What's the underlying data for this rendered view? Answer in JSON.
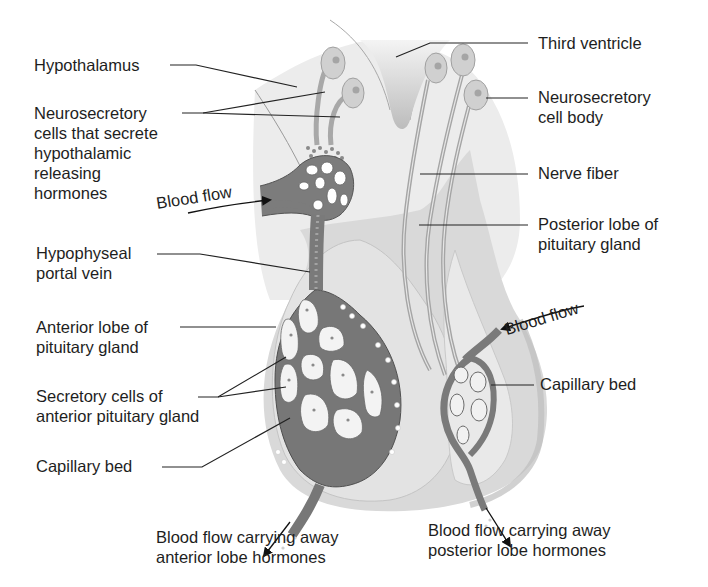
{
  "diagram": {
    "colors": {
      "background": "#ffffff",
      "tissue_light": "#ececec",
      "tissue_mid": "#d6d6d6",
      "tissue_dark": "#bdbdbd",
      "vessel": "#6e6e6e",
      "vessel_fill": "#8f8f8f",
      "cell_fill": "#f4f4f4",
      "line": "#222222"
    },
    "labels_left": {
      "hypothalamus": "Hypothalamus",
      "neurosecretory_cells": [
        "Neurosecretory",
        "cells that secrete",
        "hypothalamic",
        "releasing",
        "hormones"
      ],
      "hypophyseal_portal_vein": [
        "Hypophyseal",
        "portal vein"
      ],
      "anterior_lobe": [
        "Anterior lobe of",
        "pituitary gland"
      ],
      "secretory_cells": [
        "Secretory cells of",
        "anterior pituitary gland"
      ],
      "capillary_bed": "Capillary bed"
    },
    "labels_right": {
      "third_ventricle": "Third ventricle",
      "neurosecretory_cell_body": [
        "Neurosecretory",
        "cell body"
      ],
      "nerve_fiber": "Nerve fiber",
      "posterior_lobe": [
        "Posterior lobe of",
        "pituitary gland"
      ],
      "capillary_bed": "Capillary bed"
    },
    "flow_labels": {
      "blood_flow_in_anterior": "Blood flow",
      "blood_flow_in_posterior": "Blood flow"
    },
    "labels_bottom": {
      "anterior_out": [
        "Blood flow carrying away",
        "anterior lobe hormones"
      ],
      "posterior_out": [
        "Blood flow carrying away",
        "posterior lobe hormones"
      ]
    }
  }
}
